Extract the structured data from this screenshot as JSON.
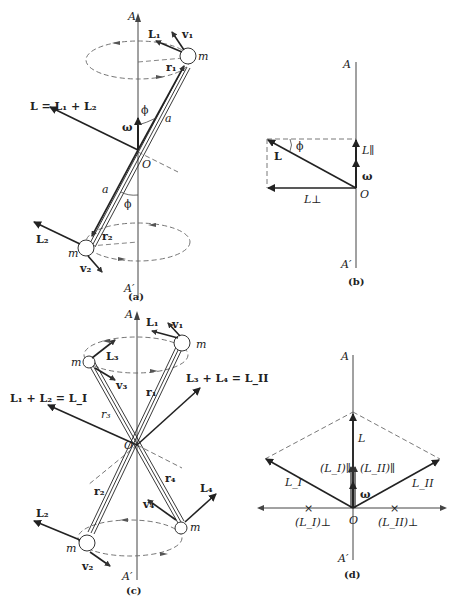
{
  "panels": {
    "a": {
      "caption": "(a)",
      "axis_top": "A",
      "axis_bottom": "A′",
      "total_L": "L = L₁ + L₂",
      "omega": "ω",
      "origin": "O",
      "phi_top": "ϕ",
      "phi_bottom": "ϕ",
      "a_top": "a",
      "a_bottom": "a",
      "m_top": "m",
      "m_bottom": "m",
      "L1": "L₁",
      "v1": "v₁",
      "r1": "r₁",
      "L2": "L₂",
      "v2": "v₂",
      "r2": "r₂"
    },
    "b": {
      "caption": "(b)",
      "axis_top": "A",
      "axis_bottom": "A′",
      "L": "L",
      "phi": "ϕ",
      "L_par": "L∥",
      "omega": "ω",
      "origin": "O",
      "L_perp": "L⊥"
    },
    "c": {
      "caption": "(c)",
      "axis_top": "A",
      "axis_bottom": "A′",
      "sum_I": "L₁ + L₂ = L_I",
      "sum_II": "L₃ + L₄ = L_II",
      "origin": "O",
      "L1": "L₁",
      "v1": "v₁",
      "L3": "L₃",
      "v3": "v₃",
      "r1": "r₁",
      "r3": "r₃",
      "r2": "r₂",
      "r4": "r₄",
      "L2": "L₂",
      "v2": "v₂",
      "L4": "L₄",
      "v4": "v₄",
      "m1": "m",
      "m2": "m",
      "m3": "m",
      "m4": "m"
    },
    "d": {
      "caption": "(d)",
      "axis_top": "A",
      "axis_bottom": "A′",
      "L": "L",
      "LI": "L_I",
      "LII": "L_II",
      "LI_par": "(L_I)∥",
      "LII_par": "(L_II)∥",
      "omega": "ω",
      "origin": "O",
      "LI_perp": "(L_I)⊥",
      "LII_perp": "(L_II)⊥"
    }
  }
}
